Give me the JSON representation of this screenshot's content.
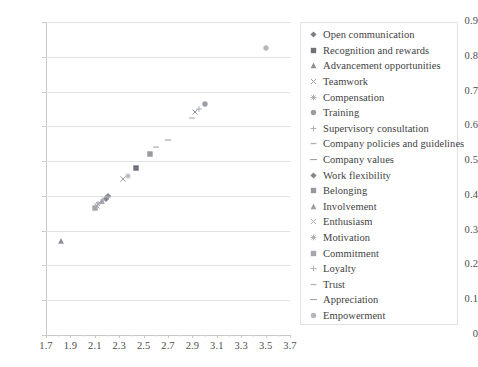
{
  "chart_data": {
    "type": "scatter",
    "title": "",
    "xlabel": "",
    "ylabel": "",
    "xlim": [
      1.7,
      3.7
    ],
    "ylim": [
      0,
      0.9
    ],
    "xticks": [
      "1.7",
      "1.9",
      "2.1",
      "2.3",
      "2.5",
      "2.7",
      "2.9",
      "3.1",
      "3.3",
      "3.5",
      "3.7"
    ],
    "yticks": [
      "0",
      "0.1",
      "0.2",
      "0.3",
      "0.4",
      "0.5",
      "0.6",
      "0.7",
      "0.8",
      "0.9"
    ],
    "grid": "horizontal",
    "legend_position": "right",
    "series": [
      {
        "name": "Open communication",
        "marker": "diamond",
        "color": "#7b7f89",
        "x": 2.19,
        "y": 0.392
      },
      {
        "name": "Recognition and rewards",
        "marker": "square",
        "color": "#6f7379",
        "x": 2.44,
        "y": 0.48
      },
      {
        "name": "Advancement opportunities",
        "marker": "triangle",
        "color": "#8d9099",
        "x": 1.82,
        "y": 0.27
      },
      {
        "name": "Teamwork",
        "marker": "x",
        "color": "#9ea1a8",
        "x": 2.12,
        "y": 0.372
      },
      {
        "name": "Compensation",
        "marker": "star",
        "color": "#a8abb1",
        "x": 2.13,
        "y": 0.376
      },
      {
        "name": "Training",
        "marker": "circle",
        "color": "#9a9ea6",
        "x": 3.0,
        "y": 0.665
      },
      {
        "name": "Supervisory consultation",
        "marker": "plus",
        "color": "#a6a9af",
        "x": 2.95,
        "y": 0.651
      },
      {
        "name": "Company policies and guidelines",
        "marker": "dash",
        "color": "#adb0b6",
        "x": 2.6,
        "y": 0.54
      },
      {
        "name": "Company values",
        "marker": "dash-long",
        "color": "#a0a3aa",
        "x": 2.7,
        "y": 0.56
      },
      {
        "name": "Work flexibility",
        "marker": "diamond",
        "color": "#81858e",
        "x": 2.21,
        "y": 0.4
      },
      {
        "name": "Belonging",
        "marker": "square",
        "color": "#96999f",
        "x": 2.55,
        "y": 0.52
      },
      {
        "name": "Involvement",
        "marker": "triangle",
        "color": "#9a9da4",
        "x": 2.16,
        "y": 0.385
      },
      {
        "name": "Enthusiasm",
        "marker": "x",
        "color": "#b0b3b9",
        "x": 2.33,
        "y": 0.448
      },
      {
        "name": "Motivation",
        "marker": "star",
        "color": "#a9acb2",
        "x": 2.37,
        "y": 0.456
      },
      {
        "name": "Commitment",
        "marker": "square",
        "color": "#a3a6ad",
        "x": 2.1,
        "y": 0.366
      },
      {
        "name": "Loyalty",
        "marker": "plus",
        "color": "#acafb5",
        "x": 2.17,
        "y": 0.388
      },
      {
        "name": "Trust",
        "marker": "dash",
        "color": "#b2b5bb",
        "x": 2.9,
        "y": 0.625
      },
      {
        "name": "Appreciation",
        "marker": "dash-long",
        "color": "#a5a8ae",
        "x": 2.14,
        "y": 0.38
      },
      {
        "name": "Empowerment",
        "marker": "circle",
        "color": "#b4b7bd",
        "x": 3.5,
        "y": 0.825
      }
    ],
    "extra_points": [
      {
        "marker": "x",
        "color": "#9da0a7",
        "x": 2.335,
        "y": 0.45
      },
      {
        "marker": "plus",
        "color": "#a2a5ac",
        "x": 2.205,
        "y": 0.398
      },
      {
        "marker": "dash",
        "color": "#a7aab0",
        "x": 2.2,
        "y": 0.396
      },
      {
        "marker": "x",
        "color": "#9396a0",
        "x": 2.925,
        "y": 0.64
      }
    ]
  },
  "legend": {
    "items": [
      {
        "label": "Open communication"
      },
      {
        "label": "Recognition and rewards"
      },
      {
        "label": "Advancement opportunities"
      },
      {
        "label": "Teamwork"
      },
      {
        "label": "Compensation"
      },
      {
        "label": "Training"
      },
      {
        "label": "Supervisory consultation"
      },
      {
        "label": "Company policies and guidelines"
      },
      {
        "label": "Company values"
      },
      {
        "label": "Work flexibility"
      },
      {
        "label": "Belonging"
      },
      {
        "label": "Involvement"
      },
      {
        "label": "Enthusiasm"
      },
      {
        "label": "Motivation"
      },
      {
        "label": "Commitment"
      },
      {
        "label": "Loyalty"
      },
      {
        "label": "Trust"
      },
      {
        "label": "Appreciation"
      },
      {
        "label": "Empowerment"
      }
    ]
  },
  "colors": {
    "gridline": "#dfe3e6",
    "axis": "#c9c9c9",
    "tick_text": "#4d4d4d",
    "legend_border": "#e2e2e2",
    "legend_text": "#3f3f3f",
    "background": "#ffffff"
  }
}
